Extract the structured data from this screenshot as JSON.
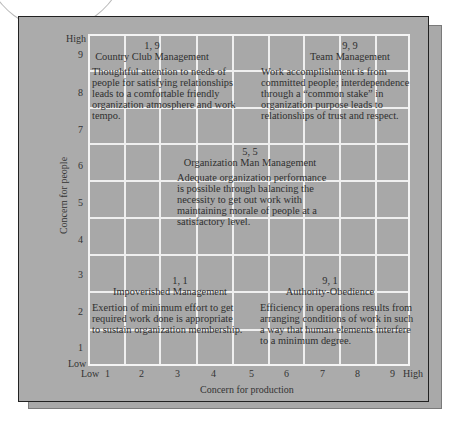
{
  "axes": {
    "y_title": "Concern for people",
    "x_title": "Concern for production",
    "y_high": "High",
    "y_low": "Low",
    "x_low": "Low",
    "x_high": "High",
    "y_ticks": [
      "9",
      "8",
      "7",
      "6",
      "5",
      "4",
      "3",
      "2",
      "1"
    ],
    "x_ticks": [
      "1",
      "2",
      "3",
      "4",
      "5",
      "6",
      "7",
      "8",
      "9"
    ]
  },
  "styles": [
    {
      "coords": "1, 9",
      "name": "Country Club Management",
      "description": [
        "Thoughtful attention to needs of",
        "people for satisfying relationships",
        "leads to a comfortable friendly",
        "organization atmosphere and work",
        "tempo."
      ]
    },
    {
      "coords": "9, 9",
      "name": "Team Management",
      "description": [
        "Work accomplishment is from",
        "committed people; interdependence",
        "through a “common stake” in",
        "organization purpose leads to",
        "relationships of trust and respect."
      ]
    },
    {
      "coords": "5, 5",
      "name": "Organization Man Management",
      "description": [
        "Adequate organization performance",
        "is possible through balancing the",
        "necessity to get out work with",
        "maintaining morale of people at a",
        "satisfactory level."
      ]
    },
    {
      "coords": "1, 1",
      "name": "Impoverished Management",
      "description": [
        "Exertion of minimum effort to get",
        "required work done is appropriate",
        "to sustain organization membership."
      ]
    },
    {
      "coords": "9, 1",
      "name": "Authority-Obedience",
      "description": [
        "Efficiency in operations results from",
        "arranging conditions of work in such",
        "a way that human elements interfere",
        "to a minimum degree."
      ]
    }
  ],
  "colors": {
    "panel": "#ababab",
    "grid_lines": "#efefef",
    "frame_border": "#222222",
    "text": "#2f2f2f"
  }
}
